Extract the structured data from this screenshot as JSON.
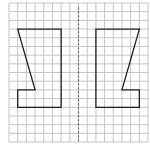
{
  "diagram": {
    "type": "grid-reflection",
    "grid": {
      "cols": 16,
      "rows": 16,
      "origin_px": [
        9,
        3
      ],
      "cell_px": 8.69,
      "line_color": "#b8b8b8",
      "background": "#ffffff"
    },
    "axis_of_symmetry": {
      "col": 8,
      "style": "dashed",
      "color": "#555555"
    },
    "shapes": [
      {
        "name": "left-shape",
        "stroke": "#222222",
        "points": [
          [
            1,
            3
          ],
          [
            6,
            3
          ],
          [
            6,
            12
          ],
          [
            1,
            12
          ],
          [
            1,
            10
          ],
          [
            3,
            10
          ]
        ]
      },
      {
        "name": "right-shape-reflection",
        "stroke": "#222222",
        "points": [
          [
            15,
            3
          ],
          [
            10,
            3
          ],
          [
            10,
            12
          ],
          [
            15,
            12
          ],
          [
            15,
            10
          ],
          [
            13,
            10
          ]
        ]
      }
    ]
  }
}
